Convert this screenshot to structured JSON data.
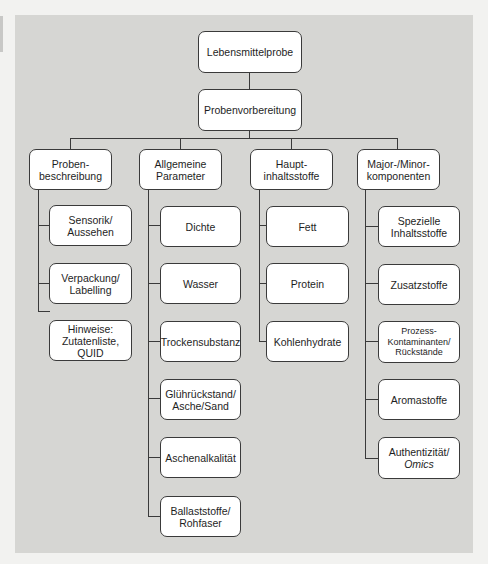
{
  "diagram": {
    "root": {
      "label": "Lebensmittelprobe"
    },
    "second": {
      "label": "Probenvorbereitung"
    },
    "columns": [
      {
        "header": "Proben-\nbeschreibung",
        "children": [
          "Sensorik/\nAussehen",
          "Verpackung/\nLabelling",
          "Hinweise:\nZutatenliste,\nQUID"
        ]
      },
      {
        "header": "Allgemeine\nParameter",
        "children": [
          "Dichte",
          "Wasser",
          "Trockensubstanz",
          "Glührückstand/\nAsche/Sand",
          "Aschenalkalität",
          "Ballaststoffe/\nRohfaser"
        ]
      },
      {
        "header": "Haupt-\ninhaltsstoffe",
        "children": [
          "Fett",
          "Protein",
          "Kohlenhydrate"
        ]
      },
      {
        "header": "Major-/Minor-\nkomponenten",
        "children": [
          "Spezielle\nInhaltsstoffe",
          "Zusatzstoffe",
          "Prozess-\nKontaminanten/\nRückstände",
          "Aromastoffe",
          "Authentizität/"
        ],
        "last_child_italic_line": "Omics"
      }
    ]
  },
  "colors": {
    "page_background": "#f2f2f0",
    "panel_background": "#d6d6d3",
    "box_fill": "#ffffff",
    "box_border": "#3a3a3a",
    "text": "#1e1e1e"
  }
}
